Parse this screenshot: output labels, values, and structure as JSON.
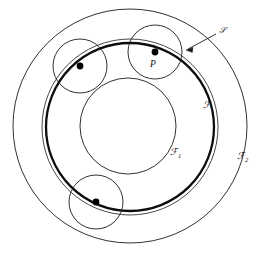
{
  "figure": {
    "background_color": "#ffffff",
    "stroke_color": "#1a1a1a",
    "dot_color": "#000000",
    "labels": {
      "point_p": "P",
      "curve_f": "ℱ",
      "curve_f1": "ℱ",
      "curve_f1_sub": "1",
      "curve_f2": "ℱ",
      "curve_f2_sub": "2",
      "circle_s": "𝒮"
    },
    "circles": {
      "f1_inner": {
        "cx": 128,
        "cy": 126,
        "r": 48,
        "stroke_width": 0.9,
        "name": "F1"
      },
      "f_bold": {
        "cx": 130,
        "cy": 127,
        "r": 84,
        "stroke_width": 2.2,
        "name": "F"
      },
      "f_thin_mid": {
        "cx": 130,
        "cy": 127,
        "r": 84,
        "stroke_width": 0.9,
        "name": "F-mid"
      },
      "f2_outer": {
        "cx": 130,
        "cy": 126,
        "r": 117,
        "stroke_width": 0.9,
        "name": "F2"
      },
      "s_upper_left": {
        "cx": 80,
        "cy": 66,
        "r": 27,
        "stroke_width": 0.9,
        "name": "S-upper-left"
      },
      "s_upper_right": {
        "cx": 155,
        "cy": 52,
        "r": 27,
        "stroke_width": 0.9,
        "name": "S-upper-right"
      },
      "s_lower_left": {
        "cx": 96,
        "cy": 202,
        "r": 27,
        "stroke_width": 0.9,
        "name": "S-lower-left"
      }
    },
    "points": [
      {
        "name": "dot-upper-left",
        "cx": 80,
        "cy": 66,
        "r": 3.4
      },
      {
        "name": "dot-p",
        "cx": 155,
        "cy": 52,
        "r": 3.4
      },
      {
        "name": "dot-lower-left",
        "cx": 96,
        "cy": 202,
        "r": 3.4
      }
    ],
    "annotation_arrow": {
      "name": "s-leader-arrow",
      "from_x": 216,
      "from_y": 34,
      "to_x": 186,
      "to_y": 50
    },
    "label_positions": {
      "point_p": {
        "x": 150,
        "y": 67,
        "size": 9
      },
      "curve_f": {
        "x": 203,
        "y": 108,
        "size": 9
      },
      "curve_f1": {
        "x": 173,
        "y": 155,
        "size": 9
      },
      "curve_f2": {
        "x": 240,
        "y": 159,
        "size": 9
      },
      "circle_s": {
        "x": 221,
        "y": 34,
        "size": 8
      }
    }
  }
}
